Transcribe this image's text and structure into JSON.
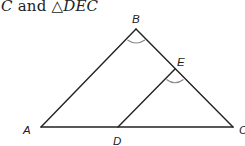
{
  "caption": {
    "prefix": "C",
    "conjunction": " and ",
    "triangle_symbol": "△",
    "triangle_name": "DEC"
  },
  "diagram": {
    "points": {
      "A": {
        "label": "A",
        "x": 41,
        "y": 127
      },
      "B": {
        "label": "B",
        "x": 136,
        "y": 29
      },
      "C": {
        "label": "C",
        "x": 233,
        "y": 127
      },
      "D": {
        "label": "D",
        "x": 118,
        "y": 127
      },
      "E": {
        "label": "E",
        "x": 175,
        "y": 69
      }
    },
    "segments": [
      "AB",
      "BC",
      "AC",
      "DE"
    ],
    "angle_marks": [
      "B",
      "E"
    ],
    "colors": {
      "line": "#222222",
      "angle_mark": "#8a8a8a"
    }
  }
}
